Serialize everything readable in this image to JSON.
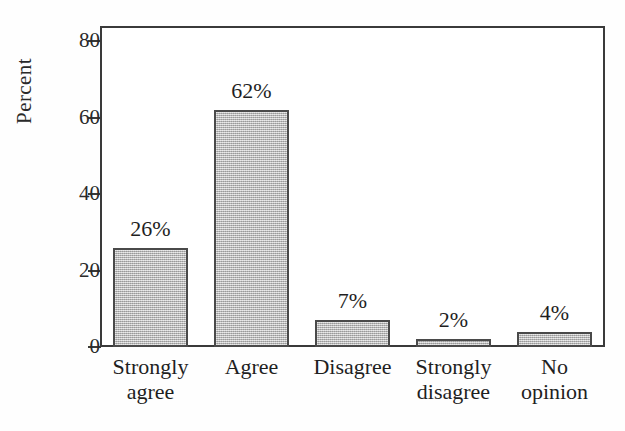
{
  "chart_data": {
    "type": "bar",
    "title": "",
    "xlabel": "",
    "ylabel": "Percent",
    "categories": [
      "Strongly agree",
      "Agree",
      "Disagree",
      "Strongly disagree",
      "No opinion"
    ],
    "category_lines": [
      [
        "Strongly",
        "agree"
      ],
      [
        "Agree",
        ""
      ],
      [
        "Disagree",
        ""
      ],
      [
        "Strongly",
        "disagree"
      ],
      [
        "No",
        "opinion"
      ]
    ],
    "values": [
      26,
      62,
      7,
      2,
      4
    ],
    "data_labels": [
      "26%",
      "62%",
      "7%",
      "2%",
      "4%"
    ],
    "ylim": [
      0,
      84
    ],
    "yticks": [
      0,
      20,
      40,
      60,
      80
    ],
    "ytick_labels": [
      "0",
      "20",
      "40",
      "60",
      "80"
    ],
    "grid": false,
    "legend": false,
    "bar_fill_color": "#bcbcbc",
    "bar_edge_color": "#4a4a4a",
    "axis_color": "#3a3a3a",
    "background_color": "#ffffff"
  }
}
